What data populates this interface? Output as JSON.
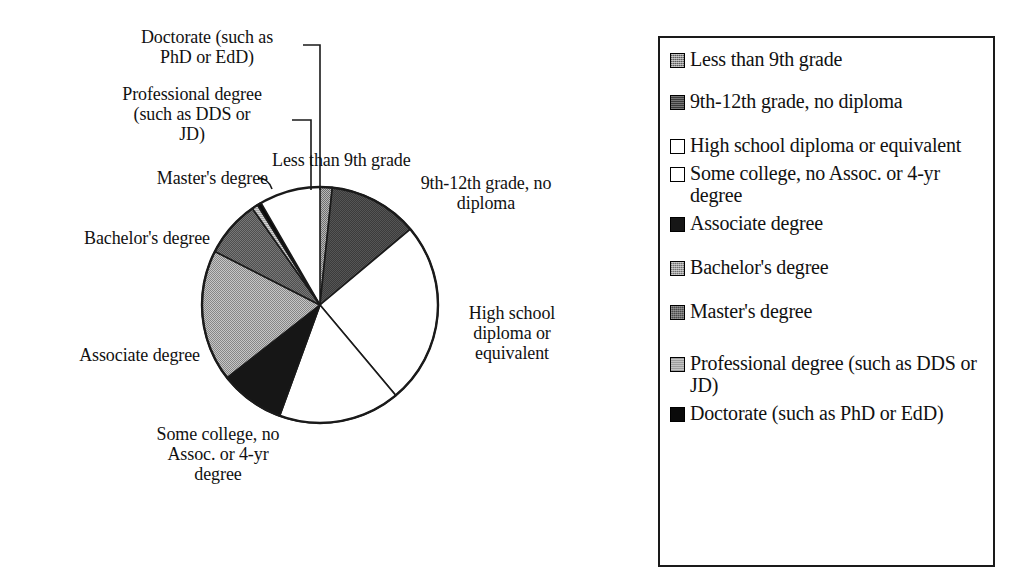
{
  "chart_data": {
    "type": "pie",
    "title": "",
    "categories": [
      "Less than 9th grade",
      "9th-12th grade, no diploma",
      "High school diploma or equivalent",
      "Some college, no Assoc. or 4-yr degree",
      "Associate degree",
      "Bachelor's degree",
      "Master's degree",
      "Professional degree (such as DDS or JD)",
      "Doctorate (such as PhD or EdD)"
    ],
    "values": [
      1.7,
      12.2,
      25.0,
      16.7,
      8.9,
      18.1,
      7.8,
      0.8,
      0.6
    ],
    "units": "percent",
    "angles_deg": [
      6,
      44,
      90,
      60,
      32,
      65,
      28,
      3,
      2
    ],
    "start_angle_deg": 0,
    "direction": "clockwise",
    "legend_position": "right",
    "grid": false,
    "slice_colors": [
      "#8d8d8d",
      "#3b3b3b",
      "#ffffff",
      "#ffffff",
      "#161616",
      "#9c9c9c",
      "#4a4a4a",
      "#c4c4c4",
      "#0a0a0a"
    ],
    "outline_color": "#1a1a1a"
  },
  "pie": {
    "center_x": 320,
    "center_y": 305,
    "radius": 118,
    "slices": [
      {
        "key": "lessthan9",
        "label": "Less than 9th grade",
        "start": 0,
        "sweep": 6,
        "fill": "#8d8d8d",
        "pattern": "checker-light"
      },
      {
        "key": "9th12th",
        "label": "9th-12th grade, no diploma",
        "start": 6,
        "sweep": 44,
        "fill": "#3b3b3b",
        "pattern": "solid-dark"
      },
      {
        "key": "highschool",
        "label": "High school diploma or equivalent",
        "start": 50,
        "sweep": 90,
        "fill": "#ffffff",
        "pattern": "none"
      },
      {
        "key": "somecollege",
        "label": "Some college, no Assoc. or 4-yr degree",
        "start": 140,
        "sweep": 60,
        "fill": "#ffffff",
        "pattern": "none"
      },
      {
        "key": "associate",
        "label": "Associate degree",
        "start": 200,
        "sweep": 32,
        "fill": "#161616",
        "pattern": "solid-black"
      },
      {
        "key": "bachelors",
        "label": "Bachelor's degree",
        "start": 232,
        "sweep": 65,
        "fill": "#9c9c9c",
        "pattern": "checker-light"
      },
      {
        "key": "masters",
        "label": "Master's degree",
        "start": 297,
        "sweep": 28,
        "fill": "#4a4a4a",
        "pattern": "checker-dark"
      },
      {
        "key": "professional",
        "label": "Professional degree (such as DDS or JD)",
        "start": 325,
        "sweep": 3,
        "fill": "#c4c4c4",
        "pattern": "hatch-light"
      },
      {
        "key": "doctorate",
        "label": "Doctorate (such as PhD or EdD)",
        "start": 328,
        "sweep": 2,
        "fill": "#0a0a0a",
        "pattern": "solid-black"
      }
    ]
  },
  "callouts": {
    "doctorate": "Doctorate (such as\nPhD or EdD)",
    "professional": "Professional degree\n(such as DDS or\nJD)",
    "masters": "Master's degree",
    "bachelors": "Bachelor's degree",
    "associate": "Associate degree",
    "somecollege": "Some college, no\nAssoc. or 4-yr\ndegree",
    "lessthan9": "Less than 9th grade",
    "ninth_twelfth": "9th-12th grade, no\ndiploma",
    "highschool": "High school\ndiploma or\nequivalent"
  },
  "legend": {
    "border_color": "#1a1a1a",
    "items": [
      {
        "label": "Less than 9th grade",
        "swatch": "fill-lessthan9"
      },
      {
        "label": "9th-12th grade, no diploma",
        "swatch": "fill-9th12th"
      },
      {
        "label": "High school diploma or equivalent",
        "swatch": "fill-highschool"
      },
      {
        "label": "Some college, no Assoc. or 4-yr degree",
        "swatch": "fill-somecollege"
      },
      {
        "label": "Associate degree",
        "swatch": "fill-associate"
      },
      {
        "label": "Bachelor's degree",
        "swatch": "fill-bachelors"
      },
      {
        "label": "Master's degree",
        "swatch": "fill-masters"
      },
      {
        "label": "Professional degree (such as DDS or JD)",
        "swatch": "fill-professional"
      },
      {
        "label": "Doctorate (such as PhD or EdD)",
        "swatch": "fill-doctorate"
      }
    ]
  }
}
